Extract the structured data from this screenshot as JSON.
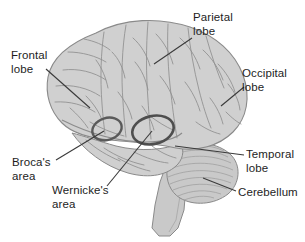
{
  "figure": {
    "background_color": "#ffffff",
    "brain_fill_color": "#d0d0d0",
    "brain_outline_color": "#8a8a8a",
    "sulci_color": "#8c8c8c",
    "highlight_circle_color": "#5a5a5a",
    "leader_line_color": "#3a3a3a",
    "label_text_color": "#1d1d1d"
  },
  "labels": {
    "frontal_lobe": "Frontal\nlobe",
    "parietal_lobe": "Parietal\nlobe",
    "occipital_lobe": "Occipital\nlobe",
    "temporal_lobe": "Temporal\nlobe",
    "cerebellum": "Cerebellum",
    "brocas_area": "Broca's\narea",
    "wernickes_area": "Wernicke's\narea"
  },
  "regions": [
    {
      "name": "frontal-lobe",
      "label": "Frontal lobe",
      "highlighted": false
    },
    {
      "name": "parietal-lobe",
      "label": "Parietal lobe",
      "highlighted": false
    },
    {
      "name": "occipital-lobe",
      "label": "Occipital lobe",
      "highlighted": false
    },
    {
      "name": "temporal-lobe",
      "label": "Temporal lobe",
      "highlighted": false
    },
    {
      "name": "cerebellum",
      "label": "Cerebellum",
      "highlighted": false
    },
    {
      "name": "brocas-area",
      "label": "Broca's area",
      "highlighted": true
    },
    {
      "name": "wernickes-area",
      "label": "Wernicke's area",
      "highlighted": true
    }
  ]
}
